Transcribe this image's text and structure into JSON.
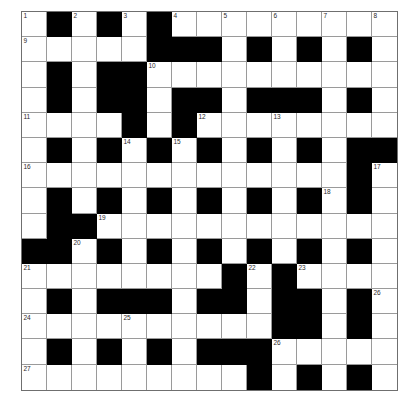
{
  "puzzle": {
    "type": "crossword-grid",
    "title": "",
    "size": {
      "rows": 15,
      "cols": 15
    },
    "colors": {
      "block": "#000000",
      "cell": "#ffffff",
      "gridline": "#9a9a9a",
      "number": "#2a2a2a"
    },
    "grid": [
      [
        "W",
        "B",
        "W",
        "B",
        "W",
        "B",
        "W",
        "W",
        "W",
        "W",
        "W",
        "W",
        "W",
        "W",
        "W"
      ],
      [
        "W",
        "W",
        "W",
        "W",
        "W",
        "B",
        "B",
        "B",
        "W",
        "B",
        "W",
        "B",
        "W",
        "B",
        "W"
      ],
      [
        "W",
        "B",
        "W",
        "B",
        "B",
        "W",
        "W",
        "W",
        "W",
        "W",
        "W",
        "W",
        "W",
        "W",
        "W"
      ],
      [
        "W",
        "B",
        "W",
        "B",
        "B",
        "W",
        "B",
        "B",
        "W",
        "B",
        "B",
        "B",
        "W",
        "B",
        "W"
      ],
      [
        "W",
        "W",
        "W",
        "W",
        "B",
        "W",
        "B",
        "W",
        "W",
        "W",
        "W",
        "W",
        "W",
        "W",
        "W"
      ],
      [
        "W",
        "B",
        "W",
        "B",
        "W",
        "B",
        "W",
        "B",
        "W",
        "B",
        "W",
        "B",
        "W",
        "B",
        "B"
      ],
      [
        "W",
        "W",
        "W",
        "W",
        "W",
        "W",
        "W",
        "W",
        "W",
        "W",
        "W",
        "W",
        "W",
        "B",
        "W"
      ],
      [
        "W",
        "B",
        "W",
        "B",
        "W",
        "B",
        "W",
        "B",
        "W",
        "B",
        "W",
        "B",
        "W",
        "B",
        "W"
      ],
      [
        "W",
        "B",
        "B",
        "W",
        "W",
        "W",
        "W",
        "W",
        "W",
        "W",
        "W",
        "W",
        "W",
        "W",
        "W"
      ],
      [
        "B",
        "B",
        "W",
        "B",
        "W",
        "B",
        "W",
        "B",
        "W",
        "B",
        "W",
        "B",
        "W",
        "B",
        "W"
      ],
      [
        "W",
        "W",
        "W",
        "W",
        "W",
        "W",
        "W",
        "W",
        "B",
        "W",
        "B",
        "W",
        "W",
        "W",
        "W"
      ],
      [
        "W",
        "B",
        "W",
        "B",
        "B",
        "B",
        "W",
        "B",
        "B",
        "W",
        "B",
        "B",
        "W",
        "B",
        "W"
      ],
      [
        "W",
        "W",
        "W",
        "W",
        "W",
        "W",
        "W",
        "W",
        "W",
        "W",
        "B",
        "B",
        "W",
        "B",
        "W"
      ],
      [
        "W",
        "B",
        "W",
        "B",
        "W",
        "B",
        "W",
        "B",
        "B",
        "B",
        "W",
        "W",
        "W",
        "W",
        "W"
      ],
      [
        "W",
        "W",
        "W",
        "W",
        "W",
        "W",
        "W",
        "W",
        "W",
        "B",
        "W",
        "B",
        "W",
        "B",
        "W"
      ]
    ],
    "numbers": [
      {
        "row": 0,
        "col": 0,
        "n": "1"
      },
      {
        "row": 0,
        "col": 2,
        "n": "2"
      },
      {
        "row": 0,
        "col": 4,
        "n": "3"
      },
      {
        "row": 0,
        "col": 6,
        "n": "4"
      },
      {
        "row": 0,
        "col": 8,
        "n": "5"
      },
      {
        "row": 0,
        "col": 10,
        "n": "6"
      },
      {
        "row": 0,
        "col": 12,
        "n": "7"
      },
      {
        "row": 0,
        "col": 14,
        "n": "8"
      },
      {
        "row": 1,
        "col": 0,
        "n": "9"
      },
      {
        "row": 2,
        "col": 5,
        "n": "10"
      },
      {
        "row": 4,
        "col": 0,
        "n": "11"
      },
      {
        "row": 4,
        "col": 7,
        "n": "12"
      },
      {
        "row": 4,
        "col": 10,
        "n": "13"
      },
      {
        "row": 5,
        "col": 4,
        "n": "14"
      },
      {
        "row": 5,
        "col": 6,
        "n": "15"
      },
      {
        "row": 6,
        "col": 0,
        "n": "16"
      },
      {
        "row": 6,
        "col": 14,
        "n": "17"
      },
      {
        "row": 7,
        "col": 12,
        "n": "18"
      },
      {
        "row": 8,
        "col": 3,
        "n": "19"
      },
      {
        "row": 9,
        "col": 2,
        "n": "20"
      },
      {
        "row": 10,
        "col": 0,
        "n": "21"
      },
      {
        "row": 10,
        "col": 9,
        "n": "22"
      },
      {
        "row": 10,
        "col": 11,
        "n": "23"
      },
      {
        "row": 11,
        "col": 14,
        "n": "26"
      },
      {
        "row": 12,
        "col": 0,
        "n": "24"
      },
      {
        "row": 12,
        "col": 4,
        "n": "25"
      },
      {
        "row": 13,
        "col": 10,
        "n": "26"
      },
      {
        "row": 14,
        "col": 0,
        "n": "27"
      }
    ],
    "letters": []
  }
}
